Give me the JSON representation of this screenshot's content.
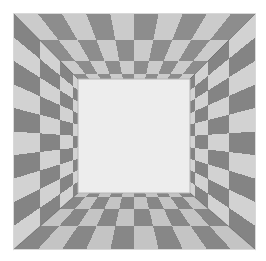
{
  "figure": {
    "title": "Checkerboard perspective room",
    "type": "perspective-illusion",
    "width": 266,
    "height": 261
  },
  "canvas": {
    "background_color": "#ffffff",
    "border_color": "#d9d9d9",
    "border_visible": true
  },
  "geometry": {
    "outer": {
      "x0": 13,
      "y0": 13,
      "x1": 256,
      "y1": 250
    },
    "inner": {
      "x0": 78,
      "y0": 79,
      "x1": 190,
      "y1": 193
    },
    "vanishing_point": {
      "x": 134,
      "y": 136
    },
    "columns": 10,
    "depth_bands": 4,
    "seam_color": "#6f6f6f",
    "seam_width": 0.8
  },
  "colors": {
    "tile_light": "#c9c9c9",
    "tile_dark": "#8b8b8b",
    "tile_light_wall": "#d2d2d2",
    "tile_dark_wall": "#848484",
    "tile_light_floor": "#c4c4c4",
    "tile_dark_floor": "#878787",
    "back_wall": "#ededed",
    "back_wall_edge": "#b6b6b6",
    "outline": "#7a7a7a"
  },
  "surfaces": [
    {
      "name": "ceiling",
      "label": "Ceiling",
      "columns": 10,
      "rows": 4,
      "parity": 0,
      "light": "#cbcbcb",
      "dark": "#8d8d8d"
    },
    {
      "name": "floor",
      "label": "Floor",
      "columns": 10,
      "rows": 4,
      "parity": 1,
      "light": "#c4c4c4",
      "dark": "#878787"
    },
    {
      "name": "left-wall",
      "label": "Left wall",
      "columns": 10,
      "rows": 4,
      "parity": 1,
      "light": "#d2d2d2",
      "dark": "#848484"
    },
    {
      "name": "right-wall",
      "label": "Right wall",
      "columns": 10,
      "rows": 4,
      "parity": 0,
      "light": "#d2d2d2",
      "dark": "#848484"
    }
  ],
  "back_wall": {
    "name": "back-wall",
    "label": "Back wall",
    "fill": "#ededed",
    "stroke": "#b6b6b6"
  }
}
